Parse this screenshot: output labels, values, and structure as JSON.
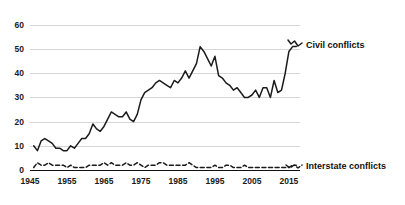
{
  "chart_data": {
    "type": "line",
    "title": "",
    "subtitle": "",
    "xlabel": "",
    "ylabel": "",
    "xlim": [
      1945,
      2018
    ],
    "ylim": [
      0,
      62
    ],
    "grid": "horizontal",
    "legend_position": "right-inline",
    "y_ticks": [
      "0",
      "10",
      "20",
      "30",
      "40",
      "50",
      "60"
    ],
    "y_tick_values": [
      0,
      10,
      20,
      30,
      40,
      50,
      60
    ],
    "x_ticks": [
      "1945",
      "1955",
      "1965",
      "1975",
      "1985",
      "1995",
      "2005",
      "2015"
    ],
    "x_tick_values": [
      1945,
      1955,
      1965,
      1975,
      1985,
      1995,
      2005,
      2015
    ],
    "x": [
      1946,
      1947,
      1948,
      1949,
      1950,
      1951,
      1952,
      1953,
      1954,
      1955,
      1956,
      1957,
      1958,
      1959,
      1960,
      1961,
      1962,
      1963,
      1964,
      1965,
      1966,
      1967,
      1968,
      1969,
      1970,
      1971,
      1972,
      1973,
      1974,
      1975,
      1976,
      1977,
      1978,
      1979,
      1980,
      1981,
      1982,
      1983,
      1984,
      1985,
      1986,
      1987,
      1988,
      1989,
      1990,
      1991,
      1992,
      1993,
      1994,
      1995,
      1996,
      1997,
      1998,
      1999,
      2000,
      2001,
      2002,
      2003,
      2004,
      2005,
      2006,
      2007,
      2008,
      2009,
      2010,
      2011,
      2012,
      2013,
      2014,
      2015,
      2016,
      2017
    ],
    "series": [
      {
        "name": "Civil conflicts",
        "style": "solid",
        "color": "#1b1b1b",
        "values": [
          10,
          8,
          12,
          13,
          12,
          11,
          9,
          9,
          8,
          8,
          10,
          9,
          11,
          13,
          13,
          15,
          19,
          17,
          16,
          18,
          21,
          24,
          23,
          22,
          22,
          24,
          21,
          20,
          23,
          29,
          32,
          33,
          34,
          36,
          37,
          36,
          35,
          34,
          37,
          36,
          38,
          41,
          38,
          41,
          44,
          51,
          49,
          46,
          43,
          47,
          39,
          38,
          36,
          35,
          33,
          34,
          32,
          30,
          30,
          31,
          33,
          30,
          34,
          34,
          30,
          37,
          32,
          33,
          40,
          49,
          51,
          51
        ]
      },
      {
        "name": "Interstate conflicts",
        "style": "dashed",
        "color": "#1b1b1b",
        "values": [
          1,
          3,
          2,
          2,
          3,
          2,
          2,
          2,
          2,
          1,
          2,
          1,
          1,
          1,
          1,
          2,
          2,
          2,
          2,
          3,
          2,
          3,
          2,
          2,
          2,
          3,
          2,
          2,
          3,
          2,
          1,
          2,
          2,
          2,
          3,
          3,
          2,
          2,
          2,
          2,
          2,
          2,
          3,
          2,
          1,
          1,
          1,
          1,
          1,
          2,
          1,
          1,
          2,
          2,
          1,
          1,
          1,
          2,
          1,
          1,
          1,
          1,
          1,
          1,
          1,
          1,
          1,
          1,
          1,
          1,
          2,
          2
        ]
      }
    ],
    "annotations": [
      {
        "name": "civil-conflicts-label",
        "text": "Civil conflicts"
      },
      {
        "name": "interstate-conflicts-label",
        "text": "Interstate conflicts"
      }
    ]
  },
  "legend": {
    "civil": "Civil conflicts",
    "interstate": "Interstate conflicts"
  }
}
